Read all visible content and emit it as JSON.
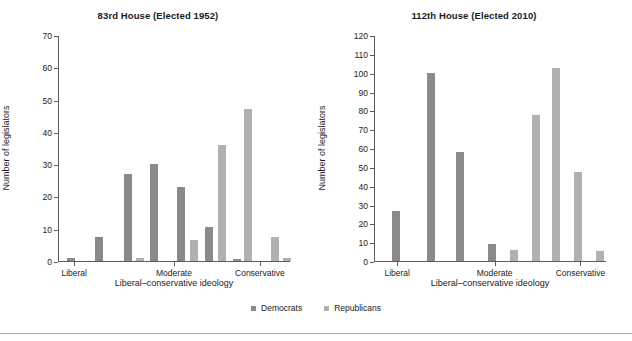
{
  "legend": {
    "items": [
      {
        "label": "Democrats",
        "color": "#8a8a8a",
        "key": "dem"
      },
      {
        "label": "Republicans",
        "color": "#b0b0b0",
        "key": "rep"
      }
    ]
  },
  "panels": [
    {
      "id": "panel-83rd",
      "title": "83rd House (Elected 1952)",
      "ylabel": "Number of legislators",
      "xlabel": "Liberal–conservative ideology",
      "yticks": [
        0,
        10,
        20,
        30,
        40,
        50,
        60,
        70
      ],
      "xticks": [
        "Liberal",
        "Moderate",
        "Conservative"
      ]
    },
    {
      "id": "panel-112th",
      "title": "112th House (Elected 2010)",
      "ylabel": "Number of legislators",
      "xlabel": "Liberal–conservative ideology",
      "yticks": [
        0,
        10,
        20,
        30,
        40,
        50,
        60,
        70,
        80,
        90,
        100,
        110,
        120
      ],
      "xticks": [
        "Liberal",
        "Moderate",
        "Conservative"
      ]
    }
  ],
  "chart_data": [
    {
      "type": "bar",
      "title": "83rd House (Elected 1952)",
      "xlabel": "Liberal–conservative ideology",
      "ylabel": "Number of legislators",
      "ylim": [
        0,
        70
      ],
      "ytick_step": 10,
      "grid": false,
      "legend_position": "bottom-center",
      "xtick_labels": [
        "Liberal",
        "Moderate",
        "Conservative"
      ],
      "xtick_positions": [
        0.07,
        0.5,
        0.87
      ],
      "bars": [
        {
          "x": 0.055,
          "value": 1.0,
          "party": "Democrats"
        },
        {
          "x": 0.175,
          "value": 7.5,
          "party": "Democrats"
        },
        {
          "x": 0.3,
          "value": 27.0,
          "party": "Democrats"
        },
        {
          "x": 0.355,
          "value": 1.0,
          "party": "Republicans"
        },
        {
          "x": 0.415,
          "value": 30.0,
          "party": "Democrats"
        },
        {
          "x": 0.53,
          "value": 23.0,
          "party": "Democrats"
        },
        {
          "x": 0.585,
          "value": 6.5,
          "party": "Republicans"
        },
        {
          "x": 0.65,
          "value": 10.5,
          "party": "Democrats"
        },
        {
          "x": 0.705,
          "value": 36.0,
          "party": "Republicans"
        },
        {
          "x": 0.77,
          "value": 0.5,
          "party": "Democrats"
        },
        {
          "x": 0.82,
          "value": 47.0,
          "party": "Republicans"
        },
        {
          "x": 0.935,
          "value": 7.5,
          "party": "Republicans"
        },
        {
          "x": 0.985,
          "value": 1.0,
          "party": "Republicans"
        }
      ]
    },
    {
      "type": "bar",
      "title": "112th House (Elected 2010)",
      "xlabel": "Liberal–conservative ideology",
      "ylabel": "Number of legislators",
      "ylim": [
        0,
        120
      ],
      "ytick_step": 10,
      "grid": false,
      "legend_position": "bottom-center",
      "xtick_labels": [
        "Liberal",
        "Moderate",
        "Conservative"
      ],
      "xtick_positions": [
        0.1,
        0.52,
        0.89
      ],
      "bars": [
        {
          "x": 0.095,
          "value": 26.5,
          "party": "Democrats"
        },
        {
          "x": 0.245,
          "value": 100.0,
          "party": "Democrats"
        },
        {
          "x": 0.37,
          "value": 58.0,
          "party": "Democrats"
        },
        {
          "x": 0.51,
          "value": 9.0,
          "party": "Democrats"
        },
        {
          "x": 0.605,
          "value": 6.0,
          "party": "Republicans"
        },
        {
          "x": 0.7,
          "value": 77.5,
          "party": "Republicans"
        },
        {
          "x": 0.785,
          "value": 102.5,
          "party": "Republicans"
        },
        {
          "x": 0.88,
          "value": 47.5,
          "party": "Republicans"
        },
        {
          "x": 0.975,
          "value": 5.5,
          "party": "Republicans"
        }
      ]
    }
  ]
}
